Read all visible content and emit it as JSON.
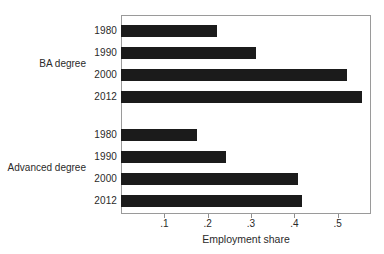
{
  "chart_data": {
    "type": "bar",
    "orientation": "horizontal",
    "title": "",
    "xlabel": "Employment share",
    "ylabel": "",
    "xlim": [
      0,
      0.577
    ],
    "xticks": [
      0.1,
      0.2,
      0.3,
      0.4,
      0.5
    ],
    "xtick_labels": [
      ".1",
      ".2",
      ".3",
      ".4",
      ".5"
    ],
    "grid": false,
    "legend": null,
    "bar_color": "#1b1b1b",
    "frame_color": "#9a9a9a",
    "groups": [
      {
        "label": "BA degree",
        "categories": [
          "1980",
          "1990",
          "2000",
          "2012"
        ],
        "values": [
          0.222,
          0.312,
          0.522,
          0.557
        ]
      },
      {
        "label": "Advanced degree",
        "categories": [
          "1980",
          "1990",
          "2000",
          "2012"
        ],
        "values": [
          0.175,
          0.242,
          0.408,
          0.418
        ]
      }
    ]
  },
  "axis": {
    "x_title": "Employment share"
  }
}
